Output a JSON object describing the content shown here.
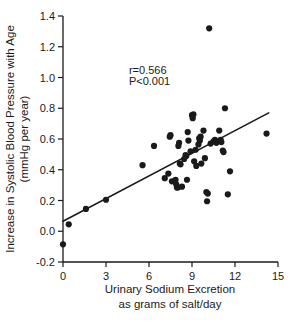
{
  "chart_data": {
    "type": "scatter",
    "title": "",
    "xlabel": "Urinary Sodium Excretion as grams of salt/day",
    "xlabel_line1": "Urinary Sodium Excretion",
    "xlabel_line2": "as grams of salt/day",
    "ylabel": "Increase in Systolic Blood Pressure with Age (mmHg per year)",
    "ylabel_line1": "Increase in Systolic Blood Pressure with Age",
    "ylabel_line2": "(mmHg per year)",
    "xlim": [
      0,
      15
    ],
    "ylim": [
      -0.2,
      1.4
    ],
    "xticks": [
      0,
      3,
      6,
      9,
      12,
      15
    ],
    "xtick_labels": [
      "0",
      "3",
      "6",
      "9",
      "12",
      "15"
    ],
    "yticks": [
      -0.2,
      0.0,
      0.2,
      0.4,
      0.6,
      0.8,
      1.0,
      1.2,
      1.4
    ],
    "ytick_labels": [
      "-0.2",
      "0.0",
      "0.2",
      "0.4",
      "0.6",
      "0.8",
      "1.0",
      "1.2",
      "1.4"
    ],
    "grid": false,
    "legend": null,
    "annotations": [
      {
        "text": "r=0.566",
        "x": 4.6,
        "y": 1.02
      },
      {
        "text": "P<0.001",
        "x": 4.6,
        "y": 0.95
      }
    ],
    "statistics": {
      "r": 0.566,
      "p_text": "P<0.001"
    },
    "trendline": {
      "type": "linear-fit",
      "x_start": 0.0,
      "y_start": 0.065,
      "x_end": 14.35,
      "y_end": 0.77,
      "slope": 0.0491,
      "intercept": 0.065
    },
    "marker": {
      "shape": "circle",
      "color": "#1a1a1a",
      "size_px": 3.1
    },
    "points": [
      [
        0.0,
        -0.085
      ],
      [
        0.4,
        0.045
      ],
      [
        1.6,
        0.145
      ],
      [
        3.0,
        0.205
      ],
      [
        5.55,
        0.43
      ],
      [
        6.35,
        0.555
      ],
      [
        7.1,
        0.345
      ],
      [
        7.35,
        0.375
      ],
      [
        7.45,
        0.615
      ],
      [
        7.5,
        0.625
      ],
      [
        7.6,
        0.325
      ],
      [
        7.85,
        0.335
      ],
      [
        7.9,
        0.305
      ],
      [
        7.95,
        0.285
      ],
      [
        8.0,
        0.285
      ],
      [
        8.05,
        0.555
      ],
      [
        8.1,
        0.575
      ],
      [
        8.15,
        0.44
      ],
      [
        8.2,
        0.435
      ],
      [
        8.3,
        0.29
      ],
      [
        8.45,
        0.47
      ],
      [
        8.55,
        0.495
      ],
      [
        8.6,
        0.49
      ],
      [
        8.65,
        0.335
      ],
      [
        8.7,
        0.645
      ],
      [
        8.75,
        0.59
      ],
      [
        8.9,
        0.52
      ],
      [
        9.0,
        0.755
      ],
      [
        9.05,
        0.735
      ],
      [
        9.1,
        0.76
      ],
      [
        9.15,
        0.455
      ],
      [
        9.25,
        0.53
      ],
      [
        9.3,
        0.425
      ],
      [
        9.45,
        0.565
      ],
      [
        9.5,
        0.605
      ],
      [
        9.55,
        0.59
      ],
      [
        9.6,
        0.615
      ],
      [
        9.65,
        0.44
      ],
      [
        9.8,
        0.655
      ],
      [
        9.9,
        0.475
      ],
      [
        10.0,
        0.255
      ],
      [
        10.05,
        0.195
      ],
      [
        10.1,
        0.245
      ],
      [
        10.2,
        1.32
      ],
      [
        10.3,
        0.57
      ],
      [
        10.5,
        0.585
      ],
      [
        10.6,
        0.595
      ],
      [
        10.7,
        0.575
      ],
      [
        10.9,
        0.655
      ],
      [
        11.0,
        0.595
      ],
      [
        11.05,
        0.58
      ],
      [
        11.15,
        0.525
      ],
      [
        11.2,
        0.515
      ],
      [
        11.3,
        0.8
      ],
      [
        11.5,
        0.24
      ],
      [
        11.65,
        0.39
      ],
      [
        14.2,
        0.635
      ]
    ]
  }
}
